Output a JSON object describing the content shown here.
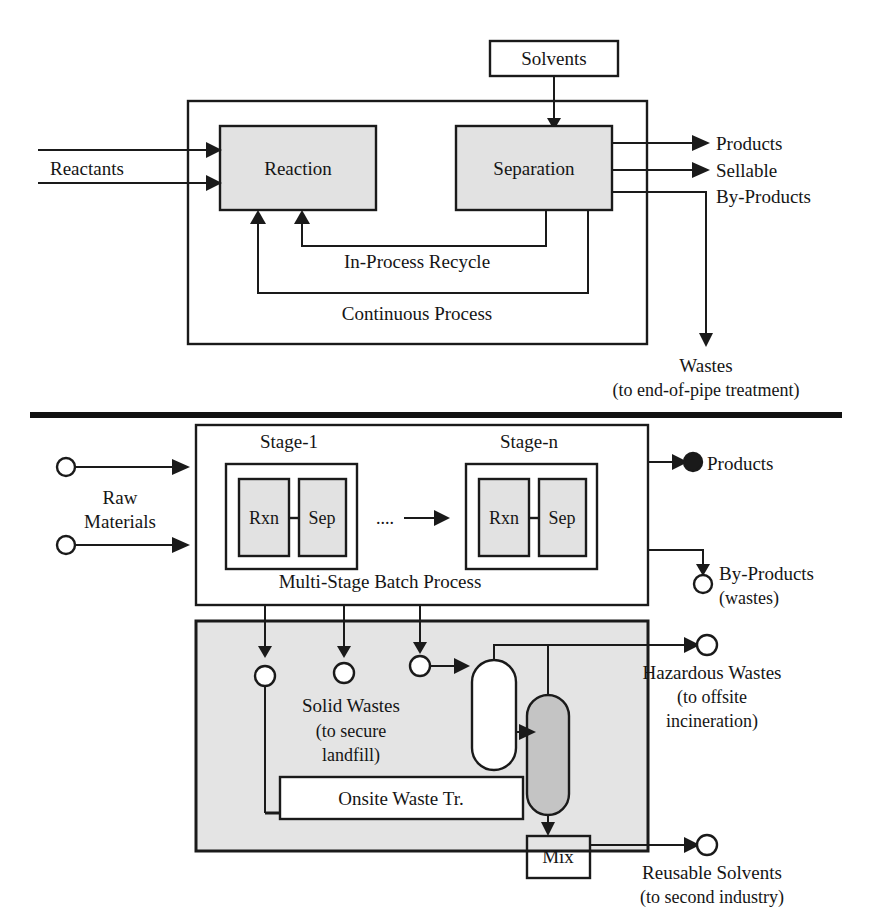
{
  "figure": {
    "kind": "process-flow-diagram",
    "colors": {
      "line": "#1a1a1a",
      "unit_fill": "#e2e2e2",
      "panel_fill": "#e4e4e4",
      "vessel_gray_fill": "#c4c4c4",
      "background": "#ffffff"
    }
  },
  "top_panel": {
    "name": "Continuous Process",
    "caption": "Continuous Process",
    "solvents_box": "Solvents",
    "units": [
      {
        "id": "reaction",
        "label": "Reaction"
      },
      {
        "id": "separation",
        "label": "Separation"
      }
    ],
    "inputs": [
      {
        "id": "reactants",
        "label": "Reactants",
        "streams": 2
      }
    ],
    "recycle_label": "In-Process Recycle",
    "outputs": [
      {
        "id": "products",
        "label": "Products"
      },
      {
        "id": "sellable-by-products",
        "label": "Sellable",
        "label2": "By-Products"
      },
      {
        "id": "wastes",
        "label": "Wastes",
        "sublabel": "(to end-of-pipe treatment)"
      }
    ]
  },
  "bottom_panel": {
    "name": "Multi-Stage Batch Process",
    "caption": "Multi-Stage Batch Process",
    "stages": [
      {
        "id": "stage-1",
        "title": "Stage-1",
        "units": [
          {
            "id": "rxn",
            "label": "Rxn"
          },
          {
            "id": "sep",
            "label": "Sep"
          }
        ]
      },
      {
        "id": "stage-n",
        "title": "Stage-n",
        "units": [
          {
            "id": "rxn",
            "label": "Rxn"
          },
          {
            "id": "sep",
            "label": "Sep"
          }
        ]
      }
    ],
    "stage_gap_marker": "....",
    "inputs": [
      {
        "id": "raw-materials",
        "label": "Raw",
        "label2": "Materials",
        "streams": 2
      }
    ],
    "outputs": [
      {
        "id": "products",
        "label": "Products"
      },
      {
        "id": "by-products",
        "label": "By-Products",
        "sublabel": "(wastes)"
      }
    ]
  },
  "waste_panel": {
    "name": "Onsite Waste Treatment",
    "treatment_box": "Onsite Waste Tr.",
    "mix_box": "Mix",
    "solid_wastes": {
      "label": "Solid Wastes",
      "sublabel1": "(to secure",
      "sublabel2": "landfill)"
    },
    "vessels": [
      {
        "id": "vessel-white",
        "fill": "#ffffff"
      },
      {
        "id": "vessel-gray",
        "fill": "#c4c4c4"
      }
    ],
    "outputs": [
      {
        "id": "hazardous-wastes",
        "label": "Hazardous Wastes",
        "sublabel1": "(to offsite",
        "sublabel2": "incineration)"
      },
      {
        "id": "reusable-solvents",
        "label": "Reusable Solvents",
        "sublabel1": "(to second industry)"
      }
    ]
  }
}
